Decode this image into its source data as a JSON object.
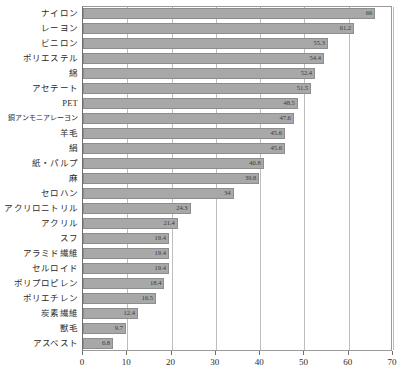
{
  "chart_data": {
    "type": "bar",
    "orientation": "horizontal",
    "title": "",
    "subtitle": "",
    "xlabel": "",
    "ylabel": "",
    "xlim": [
      0,
      70
    ],
    "ylim": null,
    "grid": true,
    "legend": null,
    "xticks": [
      0,
      10,
      20,
      30,
      40,
      50,
      60,
      70
    ],
    "xtick_labels": [
      "0",
      "10",
      "20",
      "30",
      "40",
      "50",
      "60",
      "70"
    ],
    "bar_color": "#a8a8a8",
    "bar_edge_color": "#8d8d8d",
    "categories": [
      "ナイロン",
      "レーヨン",
      "ビニロン",
      "ポリエステル",
      "綿",
      "アセテート",
      "PET",
      "銅アンモニアレーヨン",
      "羊毛",
      "絹",
      "紙・パルプ",
      "麻",
      "セロハン",
      "アクリロニトリル",
      "アクリル",
      "スフ",
      "アラミド繊維",
      "セルロイド",
      "ポリプロピレン",
      "ポリエチレン",
      "炭素繊維",
      "獣毛",
      "アスベスト"
    ],
    "values": [
      66,
      61.2,
      55.3,
      54.4,
      52.4,
      51.5,
      48.5,
      47.6,
      45.6,
      45.6,
      40.8,
      39.8,
      34,
      24.3,
      21.4,
      19.4,
      19.4,
      19.4,
      18.4,
      16.5,
      12.4,
      9.7,
      6.8
    ],
    "value_labels": [
      "66",
      "61.2",
      "55.3",
      "54.4",
      "52.4",
      "51.5",
      "48.5",
      "47.6",
      "45.6",
      "45.6",
      "40.8",
      "39.8",
      "34",
      "24.3",
      "21.4",
      "19.4",
      "19.4",
      "19.4",
      "18.4",
      "16.5",
      "12.4",
      "9.7",
      "6.8"
    ]
  }
}
